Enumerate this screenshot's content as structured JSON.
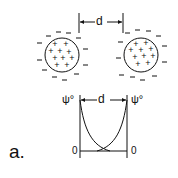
{
  "diagram": {
    "top": {
      "distance_label": "d",
      "particles": [
        {
          "name": "left-particle",
          "interior_charge": "+",
          "surrounding_charge": "−"
        },
        {
          "name": "right-particle",
          "interior_charge": "+",
          "surrounding_charge": "−"
        }
      ]
    },
    "bottom": {
      "distance_label": "d",
      "left_potential_label": "ψ°",
      "right_potential_label": "ψ°",
      "left_zero_label": "0",
      "right_zero_label": "0"
    },
    "panel_label": "a.",
    "colors": {
      "ink": "#111111",
      "background": "#ffffff"
    }
  }
}
